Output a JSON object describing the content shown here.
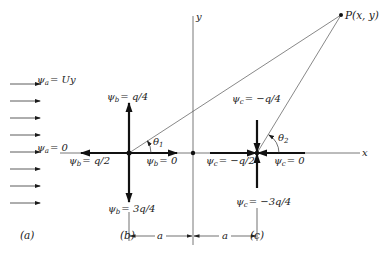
{
  "figure": {
    "panels": [
      "(a)",
      "(b)",
      "(c)"
    ],
    "axes": {
      "x_label": "x",
      "y_label": "y"
    },
    "point": {
      "label": "P(x, y)"
    },
    "angles": {
      "theta1": "θ",
      "theta1_sub": "1",
      "theta2": "θ",
      "theta2_sub": "2"
    },
    "dimension": {
      "left": "a",
      "right": "a"
    },
    "panel_a": {
      "uniform_flow_arrows": 8,
      "label_top": {
        "psi": "ψ",
        "sub": "a",
        "value": "= Uy"
      },
      "label_mid": {
        "psi": "ψ",
        "sub": "a",
        "value": "= 0"
      }
    },
    "panel_b": {
      "type": "source",
      "label_top": {
        "psi": "ψ",
        "sub": "b",
        "value": "= q/4"
      },
      "label_left": {
        "psi": "ψ",
        "sub": "b",
        "value": "= q/2"
      },
      "label_right": {
        "psi": "ψ",
        "sub": "b",
        "value": "= 0"
      },
      "label_bottom": {
        "psi": "ψ",
        "sub": "b",
        "value": "= 3q/4"
      }
    },
    "panel_c": {
      "type": "sink",
      "label_top": {
        "psi": "ψ",
        "sub": "c",
        "value": "= −q/4"
      },
      "label_left": {
        "psi": "ψ",
        "sub": "c",
        "value": "= −q/2"
      },
      "label_right": {
        "psi": "ψ",
        "sub": "c",
        "value": "= 0"
      },
      "label_bottom": {
        "psi": "ψ",
        "sub": "c",
        "value": "= −3q/4"
      }
    }
  }
}
